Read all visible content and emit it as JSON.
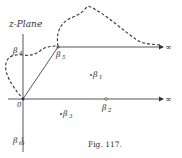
{
  "figure": {
    "plane_label": "z-Plane",
    "caption": "Fig. 117.",
    "infinity_symbol": "∞",
    "origin_label": "0",
    "points": [
      {
        "id": "beta4",
        "base": "β",
        "sub": "4"
      },
      {
        "id": "beta5",
        "base": "β",
        "sub": "5"
      },
      {
        "id": "beta1",
        "base": "β",
        "sub": "1"
      },
      {
        "id": "beta2",
        "base": "β",
        "sub": "2"
      },
      {
        "id": "beta3",
        "base": "β",
        "sub": "3"
      },
      {
        "id": "beta6",
        "base": "β",
        "sub": "6"
      }
    ],
    "colors": {
      "ink": "#333333",
      "background": "#ffffff"
    }
  }
}
